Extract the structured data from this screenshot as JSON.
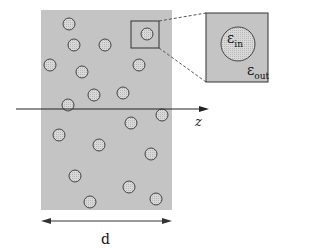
{
  "labels": {
    "axis": "z",
    "thickness": "d",
    "eps_in_main": "ε",
    "eps_in_sub": "in",
    "eps_out_main": "ε",
    "eps_out_sub": "out"
  },
  "colors": {
    "slab": "#c4c4c4",
    "particle_fill": "#dcdcdc",
    "stroke": "#333333"
  }
}
